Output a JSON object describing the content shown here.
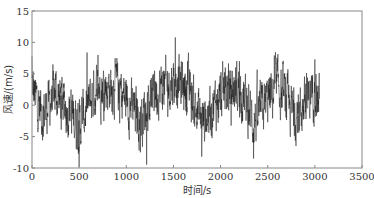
{
  "chart_data": {
    "type": "line",
    "title": "",
    "xlabel": "时间/s",
    "ylabel": "风速/(m/s)",
    "xlim": [
      0,
      3500
    ],
    "ylim": [
      -10,
      15
    ],
    "xticks": [
      0,
      500,
      1000,
      1500,
      2000,
      2500,
      3000,
      3500
    ],
    "yticks": [
      -10,
      -5,
      0,
      5,
      10,
      15
    ],
    "grid": false,
    "legend": null,
    "line_color": "#1a1a1a",
    "series": [
      {
        "name": "风速",
        "description": "Fluctuating wind speed time series sampled roughly every 1 s from 0 to ~3050 s, oscillating mostly between -8 and +8 m/s around 0.",
        "x_range": [
          0,
          3050
        ],
        "mean": 0.3,
        "typical_amplitude": 3.2,
        "key_points": [
          {
            "x": 0,
            "y": 7.8
          },
          {
            "x": 40,
            "y": 2.0
          },
          {
            "x": 120,
            "y": -5.0
          },
          {
            "x": 250,
            "y": 5.0
          },
          {
            "x": 420,
            "y": -4.5
          },
          {
            "x": 500,
            "y": -9.8
          },
          {
            "x": 700,
            "y": 8.0
          },
          {
            "x": 900,
            "y": 7.5
          },
          {
            "x": 1150,
            "y": -7.5
          },
          {
            "x": 1300,
            "y": 5.5
          },
          {
            "x": 1520,
            "y": 10.8
          },
          {
            "x": 1650,
            "y": 7.0
          },
          {
            "x": 1800,
            "y": -8.2
          },
          {
            "x": 2050,
            "y": 6.0
          },
          {
            "x": 2200,
            "y": 7.0
          },
          {
            "x": 2350,
            "y": -8.5
          },
          {
            "x": 2600,
            "y": 7.5
          },
          {
            "x": 2800,
            "y": -6.5
          },
          {
            "x": 3000,
            "y": 7.3
          },
          {
            "x": 3050,
            "y": 1.0
          }
        ]
      }
    ]
  }
}
